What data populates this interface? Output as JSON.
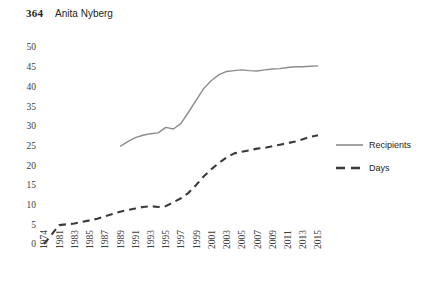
{
  "page": {
    "number": "364",
    "running_head": "Anita Nyberg"
  },
  "chart_data": {
    "type": "line",
    "title": "",
    "subtitle": "",
    "xlabel": "",
    "ylabel": "",
    "ylim": [
      0,
      50
    ],
    "ytick_step": 5,
    "grid": false,
    "legend_position": "right",
    "x_axis_note": "First tick is 1974, then odd years from 1981 to 2015",
    "xticks": [
      "1974",
      "1981",
      "1983",
      "1985",
      "1987",
      "1989",
      "1991",
      "1993",
      "1995",
      "1997",
      "1999",
      "2001",
      "2003",
      "2005",
      "2007",
      "2009",
      "2011",
      "2013",
      "2015"
    ],
    "yticks": [
      "0",
      "5",
      "10",
      "15",
      "20",
      "25",
      "30",
      "35",
      "40",
      "45",
      "50"
    ],
    "series": [
      {
        "name": "Recipients",
        "style": "solid",
        "color": "#8c8c8c",
        "x": [
          1989,
          1990,
          1991,
          1992,
          1993,
          1994,
          1995,
          1996,
          1997,
          1998,
          1999,
          2000,
          2001,
          2002,
          2003,
          2004,
          2005,
          2006,
          2007,
          2008,
          2009,
          2010,
          2011,
          2012,
          2013,
          2014,
          2015
        ],
        "values": [
          24.8,
          26.0,
          27.0,
          27.6,
          28.0,
          28.2,
          29.6,
          29.2,
          30.6,
          33.5,
          36.5,
          39.5,
          41.5,
          43.0,
          43.8,
          44.0,
          44.2,
          44.0,
          43.9,
          44.2,
          44.4,
          44.5,
          44.8,
          45.0,
          45.0,
          45.1,
          45.2
        ]
      },
      {
        "name": "Days",
        "style": "dashed",
        "color": "#3a3a3a",
        "x": [
          1974,
          1981,
          1982,
          1983,
          1984,
          1985,
          1986,
          1987,
          1988,
          1989,
          1990,
          1991,
          1992,
          1993,
          1994,
          1995,
          1996,
          1997,
          1998,
          1999,
          2000,
          2001,
          2002,
          2003,
          2004,
          2005,
          2006,
          2007,
          2008,
          2009,
          2010,
          2011,
          2012,
          2013,
          2014,
          2015
        ],
        "values": [
          0.0,
          4.8,
          5.0,
          5.2,
          5.6,
          6.0,
          6.4,
          7.0,
          7.6,
          8.2,
          8.6,
          9.0,
          9.4,
          9.6,
          9.4,
          9.6,
          10.6,
          11.6,
          13.0,
          15.0,
          17.2,
          19.0,
          20.6,
          22.0,
          23.0,
          23.4,
          23.8,
          24.2,
          24.4,
          24.8,
          25.2,
          25.6,
          26.0,
          26.6,
          27.2,
          27.6
        ]
      }
    ],
    "legend": [
      {
        "label": "Recipients",
        "style": "solid",
        "color": "#8c8c8c"
      },
      {
        "label": "Days",
        "style": "dashed",
        "color": "#3a3a3a"
      }
    ]
  }
}
